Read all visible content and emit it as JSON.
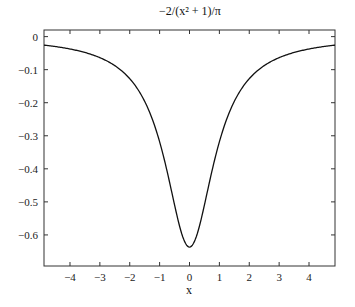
{
  "chart_data": {
    "type": "line",
    "title": "−2/(x² + 1)/π",
    "xlabel": "x",
    "ylabel": "",
    "xlim": [
      -4.87,
      4.87
    ],
    "ylim": [
      -0.694,
      0.02
    ],
    "xticks": [
      -4,
      -3,
      -2,
      -1,
      0,
      1,
      2,
      3,
      4
    ],
    "xtick_labels": [
      "−4",
      "−3",
      "−2",
      "−1",
      "0",
      "1",
      "2",
      "3",
      "4"
    ],
    "yticks": [
      0,
      -0.1,
      -0.2,
      -0.3,
      -0.4,
      -0.5,
      -0.6
    ],
    "ytick_labels": [
      "0",
      "−0.1",
      "−0.2",
      "−0.3",
      "−0.4",
      "−0.5",
      "−0.6"
    ],
    "grid": false,
    "legend": null,
    "series": [
      {
        "name": "-2/(x^2+1)/pi",
        "x": [
          -4.87,
          -4.5,
          -4,
          -3.5,
          -3,
          -2.5,
          -2,
          -1.5,
          -1.25,
          -1,
          -0.75,
          -0.5,
          -0.25,
          0,
          0.25,
          0.5,
          0.75,
          1,
          1.25,
          1.5,
          2,
          2.5,
          3,
          3.5,
          4,
          4.5,
          4.87
        ],
        "values": [
          -0.0257,
          -0.0299,
          -0.0374,
          -0.0483,
          -0.0637,
          -0.0878,
          -0.1273,
          -0.1959,
          -0.2483,
          -0.3183,
          -0.4074,
          -0.5093,
          -0.5992,
          -0.6366,
          -0.5992,
          -0.5093,
          -0.4074,
          -0.3183,
          -0.2483,
          -0.1959,
          -0.1273,
          -0.0878,
          -0.0637,
          -0.0483,
          -0.0374,
          -0.0299,
          -0.0257
        ]
      }
    ]
  }
}
